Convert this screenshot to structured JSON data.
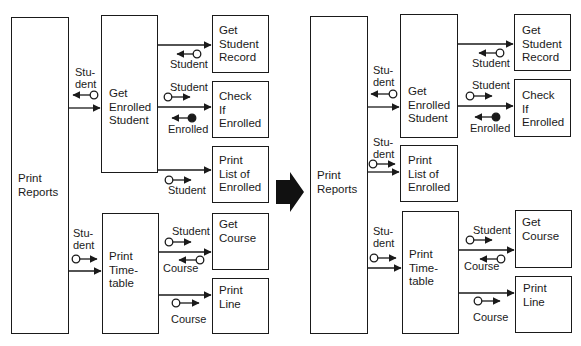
{
  "before": {
    "modules": {
      "print_reports": "Print\nReports",
      "get_enrolled_student": "Get\nEnrolled\nStudent",
      "get_student_record": "Get\nStudent\nRecord",
      "check_if_enrolled": "Check\nIf\nEnrolled",
      "print_list_of_enrolled": "Print\nList of\nEnrolled",
      "print_timetable": "Print\nTime-\ntable",
      "get_course": "Get\nCourse",
      "print_line": "Print\nLine"
    },
    "couples": {
      "pr_ges_student": "Stu-\ndent",
      "ges_gsr_student": "Student",
      "ges_cie_student": "Student",
      "cie_ges_enrolled": "Enrolled",
      "ges_ple_student": "Student",
      "pr_pt_student": "Stu-\ndent",
      "pt_gc_student": "Student",
      "gc_pt_course": "Course",
      "pt_pl_course": "Course"
    }
  },
  "transform_arrow": "right-arrow",
  "after": {
    "modules": {
      "print_reports": "Print\nReports",
      "get_enrolled_student": "Get\nEnrolled\nStudent",
      "get_student_record": "Get\nStudent\nRecord",
      "check_if_enrolled": "Check\nIf\nEnrolled",
      "print_list_of_enrolled": "Print\nList of\nEnrolled",
      "print_timetable": "Print\nTime-\ntable",
      "get_course": "Get\nCourse",
      "print_line": "Print\nLine"
    },
    "couples": {
      "pr_ges_student": "Stu-\ndent",
      "ges_gsr_student": "Student",
      "ges_cie_student": "Student",
      "cie_ges_enrolled": "Enrolled",
      "pr_ple_student": "Stu-\ndent",
      "pr_pt_student": "Stu-\ndent",
      "pt_gc_student": "Student",
      "gc_pt_course": "Course",
      "pt_pl_course": "Course"
    }
  },
  "colors": {
    "line": "#1a1a1a",
    "background": "#ffffff"
  }
}
